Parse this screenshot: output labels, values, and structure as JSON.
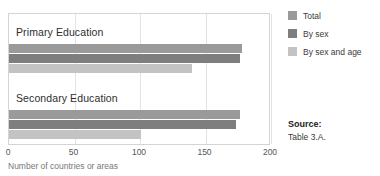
{
  "chart_data": {
    "type": "bar",
    "orientation": "horizontal",
    "title": "",
    "subtitle": "",
    "xlabel": "Number of countries or areas",
    "ylabel": "",
    "categories": [
      "Primary Education",
      "Secondary Education"
    ],
    "series": [
      {
        "name": "Total",
        "color": "#9a9a9a",
        "values": [
          178,
          176
        ]
      },
      {
        "name": "By sex",
        "color": "#7e7e7e",
        "values": [
          176,
          173
        ]
      },
      {
        "name": "By sex and age",
        "color": "#c3c3c3",
        "values": [
          140,
          101
        ]
      }
    ],
    "xlim": [
      0,
      200
    ],
    "xticks": [
      0,
      50,
      100,
      150,
      200
    ],
    "xtick_labels": [
      "0",
      "50",
      "100",
      "150",
      "200"
    ],
    "grid": true,
    "grid_axis": "x",
    "legend_position": "right-top"
  },
  "legend": {
    "items": [
      {
        "label": "Total",
        "color": "#9a9a9a"
      },
      {
        "label": "By sex",
        "color": "#7e7e7e"
      },
      {
        "label": "By sex and age",
        "color": "#c3c3c3"
      }
    ]
  },
  "source": {
    "heading": "Source:",
    "reference": "Table 3.A."
  },
  "colors": {
    "frame": "#d4d4d4",
    "gridline": "#e3e3e3",
    "axis_text": "#555555",
    "axis_title_text": "#777777",
    "category_text": "#2e2e2e",
    "background": "#ffffff"
  }
}
